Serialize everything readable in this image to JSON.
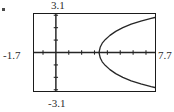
{
  "screen": {
    "name": "graphing-calculator-plot",
    "background_color": "#ffffff",
    "frame_color": "#1b1b1b",
    "curve_color": "#262626"
  },
  "window_labels": {
    "ymax": "3.1",
    "ymin": "-3.1",
    "xmin": "-1.7",
    "xmax": "7.7"
  },
  "chart_data": {
    "type": "line",
    "title": "",
    "subtitle": "",
    "xlabel": "",
    "ylabel": "",
    "xlim": [
      -1.7,
      7.7
    ],
    "ylim": [
      -3.1,
      3.1
    ],
    "grid": false,
    "legend_position": "none",
    "axes": {
      "x_axis_at_y": 0,
      "y_axis_at_x": 0,
      "x_tick_spacing": 1,
      "y_tick_spacing": 1,
      "x_ticks": [
        -1,
        0,
        1,
        2,
        3,
        4,
        5,
        6,
        7
      ],
      "y_ticks": [
        -3,
        -2,
        -1,
        0,
        1,
        2,
        3
      ]
    },
    "annotations": [
      "3.1",
      "-3.1",
      "-1.7",
      "7.7"
    ],
    "series": [
      {
        "name": "upper-branch",
        "description": "upper half of a rightward-opening parabola, vertex near x = 3.35, y = 0",
        "x": [
          3.35,
          3.45,
          3.6,
          3.85,
          4.2,
          4.65,
          5.2,
          5.85,
          6.6,
          7.4,
          7.7
        ],
        "y": [
          0.0,
          0.45,
          0.75,
          1.05,
          1.38,
          1.7,
          2.0,
          2.28,
          2.53,
          2.75,
          2.82
        ]
      },
      {
        "name": "lower-branch",
        "description": "lower half of a rightward-opening parabola, vertex near x = 3.35, y = 0",
        "x": [
          3.35,
          3.45,
          3.6,
          3.85,
          4.2,
          4.65,
          5.2,
          5.85,
          6.6,
          7.4,
          7.7
        ],
        "y": [
          0.0,
          -0.45,
          -0.75,
          -1.05,
          -1.38,
          -1.7,
          -2.0,
          -2.28,
          -2.53,
          -2.75,
          -2.82
        ]
      }
    ]
  }
}
